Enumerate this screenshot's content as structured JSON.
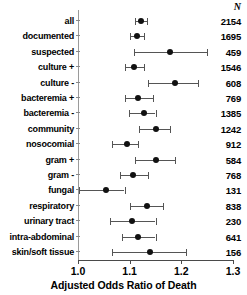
{
  "figure": {
    "n_column_header": "N",
    "axis_title": "Adjusted Odds Ratio of Death"
  },
  "chart_data": {
    "type": "scatter",
    "subtype": "forest-plot",
    "title": "",
    "xlabel": "Adjusted Odds Ratio of Death",
    "ylabel": "",
    "xlim": [
      1.0,
      1.3
    ],
    "xticks": [
      "1.0",
      "1.1",
      "1.2",
      "1.3"
    ],
    "xtick_values": [
      1.0,
      1.1,
      1.2,
      1.3
    ],
    "reference_line": 1.0,
    "grid": false,
    "legend": false,
    "extra_column_header": "N",
    "categories": [
      "all",
      "documented",
      "suspected",
      "culture +",
      "culture -",
      "bacteremia +",
      "bacteremia -",
      "community",
      "nosocomial",
      "gram +",
      "gram -",
      "fungal",
      "respiratory",
      "urinary tract",
      "intra-abdominal",
      "skin/soft tissue"
    ],
    "values": [
      1.121,
      1.114,
      1.179,
      1.109,
      1.187,
      1.117,
      1.127,
      1.15,
      1.094,
      1.15,
      1.107,
      1.055,
      1.133,
      1.105,
      1.117,
      1.14
    ],
    "ci_low": [
      1.111,
      1.1,
      1.109,
      1.09,
      1.136,
      1.09,
      1.099,
      1.119,
      1.066,
      1.111,
      1.082,
      1.002,
      1.101,
      1.062,
      1.086,
      1.066
    ],
    "ci_high": [
      1.134,
      1.127,
      1.249,
      1.127,
      1.232,
      1.146,
      1.15,
      1.179,
      1.117,
      1.187,
      1.135,
      1.09,
      1.164,
      1.15,
      1.15,
      1.209
    ],
    "n_values": [
      2154,
      1695,
      459,
      1546,
      608,
      769,
      1385,
      1242,
      912,
      584,
      768,
      131,
      838,
      230,
      641,
      156
    ],
    "colors": {
      "point": "#111111",
      "interval": "#555555",
      "axis": "#4a4a4a",
      "reference_line": "#9a9a9a",
      "background": "#ffffff"
    }
  }
}
